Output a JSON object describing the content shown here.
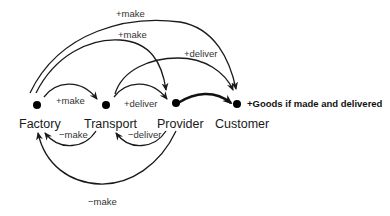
{
  "nodes": [
    {
      "id": "factory",
      "label": "Factory",
      "x": 37,
      "y": 105
    },
    {
      "id": "transport",
      "label": "Transport",
      "x": 106,
      "y": 105
    },
    {
      "id": "provider",
      "label": "Provider",
      "x": 176,
      "y": 103
    },
    {
      "id": "customer",
      "label": "Customer",
      "x": 237,
      "y": 104
    }
  ],
  "goal": {
    "label": "+Goods if made and delivered"
  },
  "edges": [
    {
      "id": "factory-transport-make",
      "from": "factory",
      "to": "transport",
      "label": "+make"
    },
    {
      "id": "transport-provider-deliver",
      "from": "transport",
      "to": "provider",
      "label": "+deliver"
    },
    {
      "id": "factory-provider-make",
      "from": "factory",
      "to": "provider",
      "label": "+make"
    },
    {
      "id": "factory-customer-make",
      "from": "factory",
      "to": "customer",
      "label": "+make"
    },
    {
      "id": "transport-customer-deliver",
      "from": "transport",
      "to": "customer",
      "label": "+deliver"
    },
    {
      "id": "provider-customer",
      "from": "provider",
      "to": "customer",
      "label": ""
    },
    {
      "id": "transport-factory-make",
      "from": "transport",
      "to": "factory",
      "label": "−make"
    },
    {
      "id": "provider-transport-deliver",
      "from": "provider",
      "to": "transport",
      "label": "−deliver"
    },
    {
      "id": "provider-factory-make",
      "from": "provider",
      "to": "factory",
      "label": "−make"
    }
  ]
}
